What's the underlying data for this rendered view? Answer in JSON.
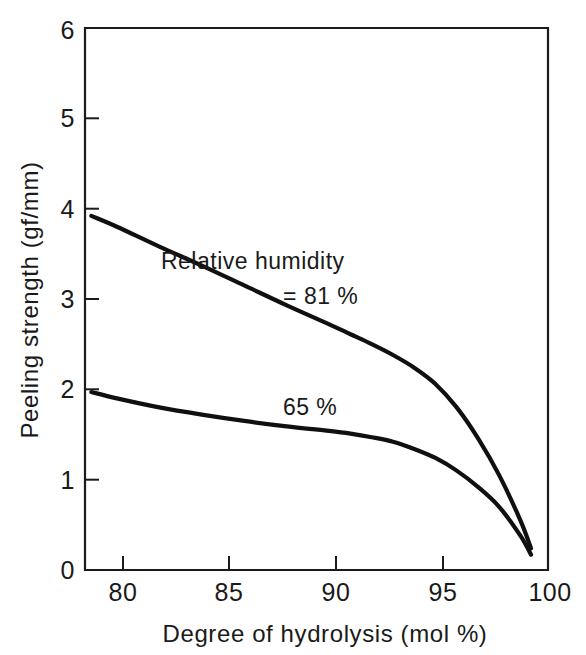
{
  "figure": {
    "background_color": "#ffffff",
    "ink_color": "#1a1a1a",
    "curve_color": "#101010"
  },
  "chart_data": {
    "type": "line",
    "title": "",
    "subtitle": "",
    "xlabel": "Degree of hydrolysis (mol %)",
    "ylabel": "Peeling strength (gf/mm)",
    "xlim": [
      78.5,
      100.3
    ],
    "ylim": [
      0,
      6
    ],
    "xticks": [
      80,
      85,
      90,
      95,
      100
    ],
    "xtick_labels": [
      "80",
      "85",
      "90",
      "95",
      "100"
    ],
    "yticks": [
      0,
      1,
      2,
      3,
      4,
      5,
      6
    ],
    "ytick_labels": [
      "0",
      "1",
      "2",
      "3",
      "4",
      "5",
      "6"
    ],
    "grid": false,
    "legend_position": "inline-annotation",
    "series": [
      {
        "name": "Relative humidity = 81 %",
        "label_lines": [
          "Relative humidity",
          "= 81 %"
        ],
        "x": [
          78.8,
          80.0,
          82.0,
          84.0,
          86.0,
          88.0,
          90.0,
          91.0,
          92.0,
          93.0,
          94.0,
          95.0,
          96.0,
          97.0,
          98.0,
          99.0,
          99.5
        ],
        "y": [
          3.92,
          3.8,
          3.58,
          3.37,
          3.15,
          2.93,
          2.72,
          2.61,
          2.5,
          2.38,
          2.24,
          2.06,
          1.8,
          1.46,
          1.05,
          0.55,
          0.24
        ]
      },
      {
        "name": "65 %",
        "label_lines": [
          "65 %"
        ],
        "x": [
          78.8,
          80.0,
          82.0,
          84.0,
          86.0,
          88.0,
          90.0,
          91.0,
          92.0,
          93.0,
          94.0,
          95.0,
          96.0,
          97.0,
          98.0,
          99.0,
          99.5
        ],
        "y": [
          1.97,
          1.9,
          1.8,
          1.72,
          1.65,
          1.59,
          1.54,
          1.51,
          1.47,
          1.42,
          1.34,
          1.24,
          1.1,
          0.92,
          0.7,
          0.38,
          0.17
        ]
      }
    ],
    "annotations": [
      {
        "text": "Relative humidity",
        "x": 86.4,
        "y": 3.33
      },
      {
        "text": "= 81 %",
        "x": 89.6,
        "y": 2.95
      },
      {
        "text": "65 %",
        "x": 89.1,
        "y": 1.72
      }
    ]
  }
}
